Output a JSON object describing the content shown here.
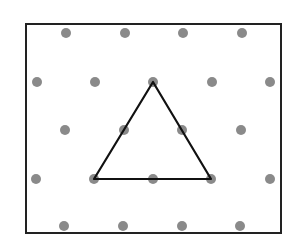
{
  "diagram": {
    "type": "isometric-dot-grid",
    "frame": {
      "x": 26,
      "y": 24,
      "width": 255,
      "height": 209,
      "stroke": "#222222",
      "stroke_width": 2
    },
    "dot_color": "#8a8a8a",
    "dot_radius": 5,
    "dots": [
      [
        66,
        33
      ],
      [
        125,
        33
      ],
      [
        183,
        33
      ],
      [
        242,
        33
      ],
      [
        37,
        82
      ],
      [
        95,
        82
      ],
      [
        153,
        82
      ],
      [
        212,
        82
      ],
      [
        270,
        82
      ],
      [
        65,
        130
      ],
      [
        124,
        130
      ],
      [
        182,
        130
      ],
      [
        241,
        130
      ],
      [
        36,
        179
      ],
      [
        94,
        179
      ],
      [
        153,
        179
      ],
      [
        211,
        179
      ],
      [
        270,
        179
      ],
      [
        64,
        226
      ],
      [
        123,
        226
      ],
      [
        182,
        226
      ],
      [
        240,
        226
      ]
    ],
    "shape": {
      "name": "equilateral-triangle",
      "points": [
        [
          153,
          82
        ],
        [
          94,
          179
        ],
        [
          211,
          179
        ]
      ],
      "stroke": "#111111",
      "stroke_width": 2.2
    }
  }
}
